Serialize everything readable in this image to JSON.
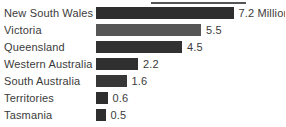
{
  "chart_data": {
    "type": "bar",
    "orientation": "horizontal",
    "title": "",
    "xlabel": "",
    "ylabel": "",
    "unit": "Million",
    "grid": false,
    "legend": false,
    "xlim": [
      0,
      7.5
    ],
    "categories": [
      "New South Wales",
      "Victoria",
      "Queensland",
      "Western Australia",
      "South Australia",
      "Territories",
      "Tasmania"
    ],
    "values": [
      7.2,
      5.5,
      4.5,
      2.2,
      1.6,
      0.6,
      0.5
    ],
    "value_labels": [
      "7.2 Million",
      "5.5",
      "4.5",
      "2.2",
      "1.6",
      "0.6",
      "0.5"
    ],
    "bar_colors": [
      "#2e2e2e",
      "#565656",
      "#323232",
      "#2f2f2f",
      "#373737",
      "#2e2e2e",
      "#2e2e2e"
    ],
    "px_per_unit": 19.1
  },
  "colors": {
    "background": "#ffffff",
    "text": "#3b3b3b",
    "crop_fragment": "#555555"
  }
}
